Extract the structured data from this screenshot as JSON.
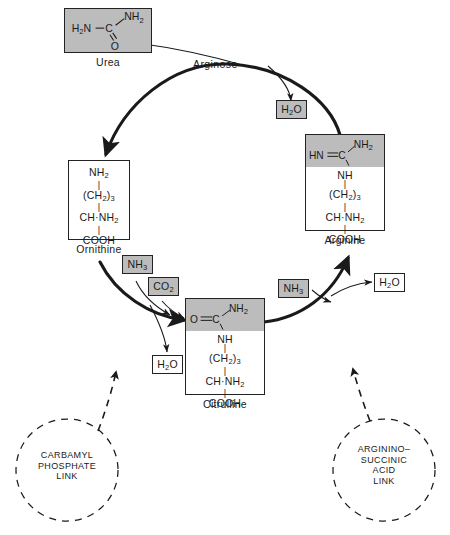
{
  "figure": {
    "colors": {
      "shade_gray": "#bcbcbc",
      "stroke": "#222222",
      "background": "#ffffff"
    }
  },
  "metabolites": [
    {
      "id": "urea",
      "name": "Urea",
      "shaded": true,
      "structure_lines": [
        "H2N—C",
        "NH2",
        "O"
      ],
      "structure_display": "H₂N—C( =O )—NH₂"
    },
    {
      "id": "ornithine",
      "name": "Ornithine",
      "shaded": false,
      "structure_lines": [
        "NH2",
        "(CH2)3",
        "CH·NH2",
        "COOH"
      ]
    },
    {
      "id": "arginine",
      "name": "Arginine",
      "shaded": true,
      "band_line": "HN=C—NH2",
      "structure_lines": [
        "NH",
        "(CH2)3",
        "CH·NH2",
        "COOH"
      ]
    },
    {
      "id": "citrulline",
      "name": "Citrulline",
      "shaded": true,
      "band_line": "O=C—NH2",
      "structure_lines": [
        "NH",
        "(CH2)3",
        "CH·NH2",
        "COOH"
      ]
    }
  ],
  "urea_box": {
    "left_group": "H₂N",
    "bond": "—",
    "center_atom": "C",
    "upper_right": "NH₂",
    "lower": "O",
    "caption": "Urea"
  },
  "ornithine_box": {
    "line1": "NH₂",
    "line2": "(CH₂)₃",
    "line3": "CH·NH₂",
    "line4": "COOH",
    "caption": "Ornithine"
  },
  "arginine_box": {
    "band_left": "HN=C",
    "band_right": "NH₂",
    "line2": "NH",
    "line3": "(CH₂)₃",
    "line4": "CH·NH₂",
    "line5": "COOH",
    "caption": "Arginine"
  },
  "citrulline_box": {
    "band_left": "O=C",
    "band_right": "NH₂",
    "line2": "NH",
    "line3": "(CH₂)₃",
    "line4": "CH·NH₂",
    "line5": "COOH",
    "caption": "Citrulline"
  },
  "enzymes": [
    {
      "id": "arginase",
      "label": "Arginose"
    }
  ],
  "reagents": [
    {
      "id": "water-top",
      "label": "H₂O",
      "shaded": true,
      "role": "product"
    },
    {
      "id": "ammonia-left",
      "label": "NH₃",
      "shaded": true,
      "role": "substrate"
    },
    {
      "id": "carbon-dioxide",
      "label": "CO₂",
      "shaded": true,
      "role": "substrate"
    },
    {
      "id": "water-left",
      "label": "H₂O",
      "shaded": false,
      "role": "product"
    },
    {
      "id": "ammonia-right",
      "label": "NH₃",
      "shaded": true,
      "role": "substrate"
    },
    {
      "id": "water-right",
      "label": "H₂O",
      "shaded": false,
      "role": "product"
    }
  ],
  "reagent_labels": {
    "water_top": "H₂O",
    "ammonia_left": "NH₃",
    "carbon_dioxide": "CO₂",
    "water_left": "H₂O",
    "ammonia_right": "NH₃",
    "water_right": "H₂O"
  },
  "links": [
    {
      "id": "carbamyl-phosphate-link",
      "text": "CARBAMYL\nPHOSPHATE\nLINK",
      "shape": "dashed-circle"
    },
    {
      "id": "argininosuccinic-acid-link",
      "text": "ARGININO–\nSUCCINIC\nACID\nLINK",
      "shape": "dashed-circle"
    }
  ]
}
